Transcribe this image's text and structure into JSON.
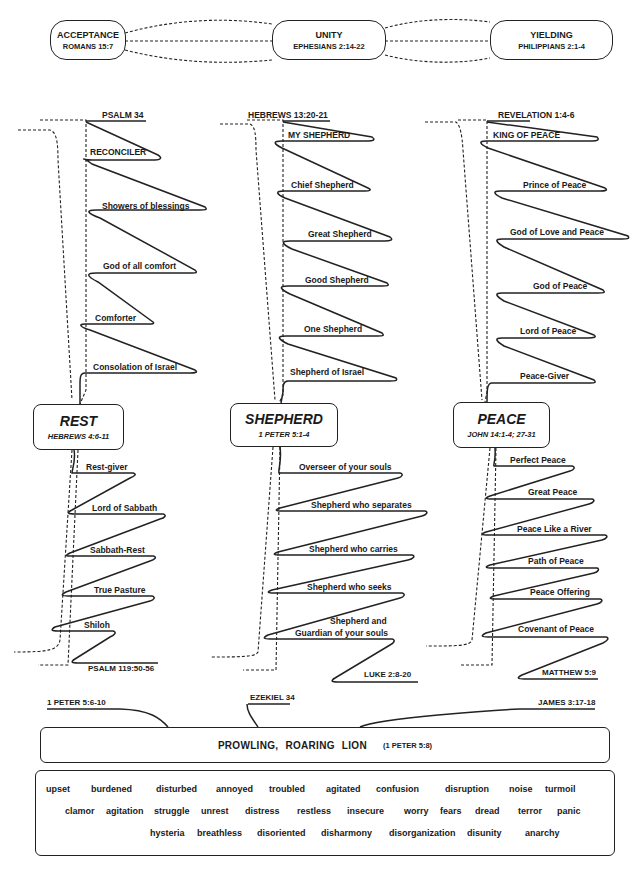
{
  "top_row": {
    "boxes": [
      {
        "title": "ACCEPTANCE",
        "ref": "ROMANS 15:7"
      },
      {
        "title": "UNITY",
        "ref": "EPHESIANS 2:14-22"
      },
      {
        "title": "YIELDING",
        "ref": "PHILIPPIANS 2:1-4"
      }
    ]
  },
  "columns": [
    {
      "top_ref": "PSALM 34",
      "upper_items": [
        "RECONCILER",
        "Showers of blessings",
        "God of all comfort",
        "Comforter",
        "Consolation of Israel"
      ],
      "box": {
        "title": "REST",
        "ref": "HEBREWS 4:6-11"
      },
      "lower_items": [
        "Rest-giver",
        "Lord of Sabbath",
        "Sabbath-Rest",
        "True Pasture",
        "Shiloh"
      ],
      "bottom_ref": "PSALM 119:50-56"
    },
    {
      "top_ref": "HEBREWS 13:20-21",
      "upper_items": [
        "MY SHEPHERD",
        "Chief Shepherd",
        "Great Shepherd",
        "Good Shepherd",
        "One Shepherd",
        "Shepherd of Israel"
      ],
      "box": {
        "title": "SHEPHERD",
        "ref": "1 PETER 5:1-4"
      },
      "lower_items": [
        "Overseer of your souls",
        "Shepherd who separates",
        "Shepherd who carries",
        "Shepherd who seeks",
        "Shepherd and",
        "Guardian of your souls"
      ],
      "bottom_ref": "LUKE 2:8-20"
    },
    {
      "top_ref": "REVELATION 1:4-6",
      "upper_items": [
        "KING OF PEACE",
        "Prince of Peace",
        "God of Love and Peace",
        "God of Peace",
        "Lord of Peace",
        "Peace-Giver"
      ],
      "box": {
        "title": "PEACE",
        "ref": "JOHN 14:1-4; 27-31"
      },
      "lower_items": [
        "Perfect Peace",
        "Great Peace",
        "Peace Like a River",
        "Path of Peace",
        "Peace Offering",
        "Covenant of Peace"
      ],
      "bottom_ref": "MATTHEW 5:9"
    }
  ],
  "bottom": {
    "refs": [
      "1 PETER 5:6-10",
      "EZEKIEL 34",
      "JAMES 3:17-18"
    ],
    "lion_title": "PROWLING,  ROARING  LION",
    "lion_ref": "(1 PETER 5:8)",
    "words": [
      [
        "upset",
        "burdened",
        "disturbed",
        "annoyed",
        "troubled",
        "agitated",
        "confusion",
        "disruption",
        "noise",
        "turmoil"
      ],
      [
        "clamor",
        "agitation",
        "struggle",
        "unrest",
        "distress",
        "restless",
        "insecure",
        "worry",
        "fears",
        "dread",
        "terror",
        "panic"
      ],
      [
        "hysteria",
        "breathless",
        "disoriented",
        "disharmony",
        "disorganization",
        "disunity",
        "anarchy"
      ]
    ]
  },
  "colors": {
    "ink": "#1a1a1a",
    "background": "#ffffff"
  }
}
